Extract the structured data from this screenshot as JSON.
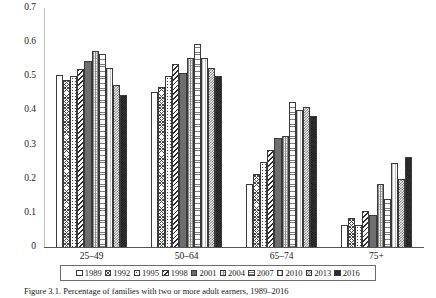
{
  "chart_data": {
    "type": "bar",
    "title": "",
    "xlabel": "",
    "ylabel": "",
    "ylim": [
      0,
      0.7
    ],
    "ytick_labels": [
      "0.7",
      "0.6",
      "0.5",
      "0.4",
      "0.3",
      "0.2",
      "0.1",
      "0"
    ],
    "ytick_values": [
      0.7,
      0.6,
      0.5,
      0.4,
      0.3,
      0.2,
      0.1,
      0
    ],
    "grid": false,
    "legend_position": "bottom",
    "categories": [
      "25–49",
      "50–64",
      "65–74",
      "75+"
    ],
    "series": [
      {
        "name": "1989",
        "pattern": "plain-white",
        "values": [
          0.505,
          0.455,
          0.185,
          0.065
        ]
      },
      {
        "name": "1992",
        "pattern": "diagonal-crosshatch",
        "values": [
          0.49,
          0.47,
          0.215,
          0.085
        ]
      },
      {
        "name": "1995",
        "pattern": "sparse-dots",
        "values": [
          0.5,
          0.5,
          0.25,
          0.065
        ]
      },
      {
        "name": "1998",
        "pattern": "bold-diagonal-stripes",
        "values": [
          0.52,
          0.535,
          0.285,
          0.105
        ]
      },
      {
        "name": "2001",
        "pattern": "solid-dark-gray",
        "values": [
          0.545,
          0.51,
          0.32,
          0.095
        ]
      },
      {
        "name": "2004",
        "pattern": "vertical-dotted",
        "values": [
          0.575,
          0.555,
          0.325,
          0.185
        ]
      },
      {
        "name": "2007",
        "pattern": "horizontal-hatch",
        "values": [
          0.565,
          0.595,
          0.425,
          0.14
        ]
      },
      {
        "name": "2010",
        "pattern": "light-vertical-lines",
        "values": [
          0.525,
          0.555,
          0.4,
          0.245
        ]
      },
      {
        "name": "2013",
        "pattern": "medium-checkerboard",
        "values": [
          0.475,
          0.525,
          0.41,
          0.2
        ]
      },
      {
        "name": "2016",
        "pattern": "dark-checkerboard",
        "values": [
          0.445,
          0.5,
          0.385,
          0.265
        ]
      }
    ]
  },
  "legend": {
    "items": [
      {
        "label": "1989"
      },
      {
        "label": "1992"
      },
      {
        "label": "1995"
      },
      {
        "label": "1998"
      },
      {
        "label": "2001"
      },
      {
        "label": "2004"
      },
      {
        "label": "2007"
      },
      {
        "label": "2010"
      },
      {
        "label": "2013"
      },
      {
        "label": "2016"
      }
    ]
  },
  "caption": {
    "text": "Figure 3.1. Percentage of families with two or more adult earners, 1989–2016"
  }
}
